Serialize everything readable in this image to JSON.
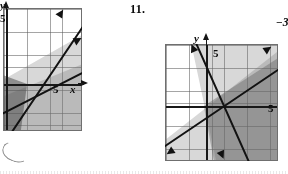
{
  "document": {
    "type": "textbook-exercise-page",
    "description": "Two coordinate graphs of systems of linear inequalities with shaded solution regions"
  },
  "problems": [
    {
      "number": "",
      "graph": {
        "name": "left-graph",
        "axis_labels": {
          "x": "x",
          "y": "y"
        },
        "tick_labels": {
          "x": "5",
          "y": "5"
        },
        "lines": [
          {
            "name": "steep-line",
            "slope_desc": "steep positive slope through origin region"
          },
          {
            "name": "shallow-line",
            "slope_desc": "shallow positive slope"
          }
        ],
        "shaded_regions": [
          "below-steep-line",
          "below-shallow-line",
          "overlap-wedge"
        ]
      }
    },
    {
      "number": "11.",
      "equations": [
        "x −",
        "−3x −"
      ],
      "graph": {
        "name": "right-graph",
        "axis_labels": {
          "x": "",
          "y": "y"
        },
        "tick_labels": {
          "x": "5",
          "y": "5"
        },
        "lines": [
          {
            "name": "negative-steep-line",
            "slope_desc": "steep negative slope"
          },
          {
            "name": "positive-line",
            "slope_desc": "positive slope rising to the right"
          }
        ],
        "shaded_regions": [
          "right-of-negative-line",
          "below-positive-line",
          "overlap-right"
        ]
      }
    }
  ],
  "colors": {
    "ink": "#141414",
    "grid": "#5a5a5a",
    "shade_light": "#787878",
    "shade_mid": "#5f5f5f",
    "shade_dark": "#464646",
    "paper": "#fdfdfd"
  }
}
